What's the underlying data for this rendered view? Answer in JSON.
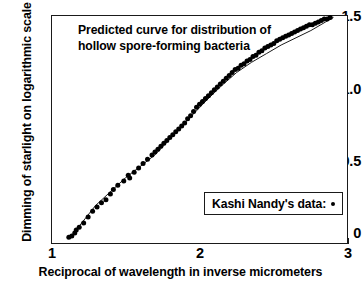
{
  "chart_data": {
    "type": "scatter",
    "title": "Predicted curve for distribution of hollow spore-forming bacteria",
    "title_line1": "Predicted curve for distribution of",
    "title_line2": "hollow spore-forming bacteria",
    "xlabel": "Reciprocal of wavelength in inverse micrometers",
    "ylabel": "Dimming of starlight on logarithmic scale",
    "xlim": [
      1,
      3
    ],
    "ylim": [
      -0.05,
      1.5
    ],
    "xticks": [
      1,
      2,
      3
    ],
    "xtick_labels": [
      "1",
      "2",
      "3"
    ],
    "yticks": [
      0,
      0.5,
      1.0,
      1.5
    ],
    "ytick_labels": [
      "0",
      "0.5",
      "1.0",
      "1.5"
    ],
    "grid": false,
    "legend_position": "lower-right",
    "legend": [
      {
        "name": "Kashi Nandy's data:",
        "marker": "dot",
        "color": "#000000"
      }
    ],
    "marker_color": "#000000",
    "line_color": "#1a1a1a",
    "series": [
      {
        "name": "Kashi Nandy's data",
        "style": "markers",
        "marker": "dot",
        "x": [
          1.12,
          1.14,
          1.16,
          1.17,
          1.19,
          1.22,
          1.25,
          1.28,
          1.31,
          1.34,
          1.37,
          1.4,
          1.42,
          1.45,
          1.49,
          1.52,
          1.53,
          1.56,
          1.59,
          1.62,
          1.65,
          1.68,
          1.7,
          1.72,
          1.74,
          1.76,
          1.78,
          1.8,
          1.82,
          1.84,
          1.86,
          1.88,
          1.9,
          1.92,
          1.94,
          1.96,
          1.98,
          2.0,
          2.02,
          2.04,
          2.06,
          2.08,
          2.1,
          2.12,
          2.14,
          2.16,
          2.18,
          2.2,
          2.22,
          2.24,
          2.26,
          2.28,
          2.3,
          2.32,
          2.34,
          2.36,
          2.38,
          2.4,
          2.42,
          2.44,
          2.46,
          2.48,
          2.5,
          2.52,
          2.54,
          2.56,
          2.58,
          2.6,
          2.62,
          2.64,
          2.66,
          2.68,
          2.7,
          2.72,
          2.74,
          2.76,
          2.78,
          2.8,
          2.82,
          2.84,
          2.86,
          2.88
        ],
        "y": [
          -0.03,
          -0.02,
          0.0,
          0.02,
          0.04,
          0.07,
          0.11,
          0.15,
          0.18,
          0.21,
          0.23,
          0.27,
          0.3,
          0.33,
          0.36,
          0.4,
          0.38,
          0.42,
          0.45,
          0.48,
          0.51,
          0.54,
          0.56,
          0.58,
          0.6,
          0.62,
          0.64,
          0.66,
          0.68,
          0.7,
          0.72,
          0.74,
          0.76,
          0.79,
          0.81,
          0.84,
          0.87,
          0.89,
          0.91,
          0.93,
          0.95,
          0.97,
          0.99,
          1.01,
          1.03,
          1.05,
          1.07,
          1.09,
          1.11,
          1.13,
          1.14,
          1.16,
          1.17,
          1.19,
          1.2,
          1.22,
          1.23,
          1.25,
          1.26,
          1.28,
          1.29,
          1.3,
          1.31,
          1.33,
          1.34,
          1.35,
          1.36,
          1.37,
          1.38,
          1.39,
          1.4,
          1.41,
          1.42,
          1.43,
          1.44,
          1.44,
          1.45,
          1.46,
          1.47,
          1.48,
          1.48,
          1.49
        ]
      },
      {
        "name": "Predicted curve",
        "style": "line",
        "x": [
          1.13,
          1.3,
          1.5,
          1.7,
          1.9,
          2.05,
          2.15,
          2.25,
          2.35,
          2.45,
          2.55,
          2.65,
          2.75,
          2.85,
          2.9
        ],
        "y": [
          -0.03,
          0.19,
          0.38,
          0.54,
          0.76,
          0.92,
          1.02,
          1.11,
          1.18,
          1.24,
          1.3,
          1.35,
          1.4,
          1.46,
          1.49
        ]
      }
    ]
  }
}
